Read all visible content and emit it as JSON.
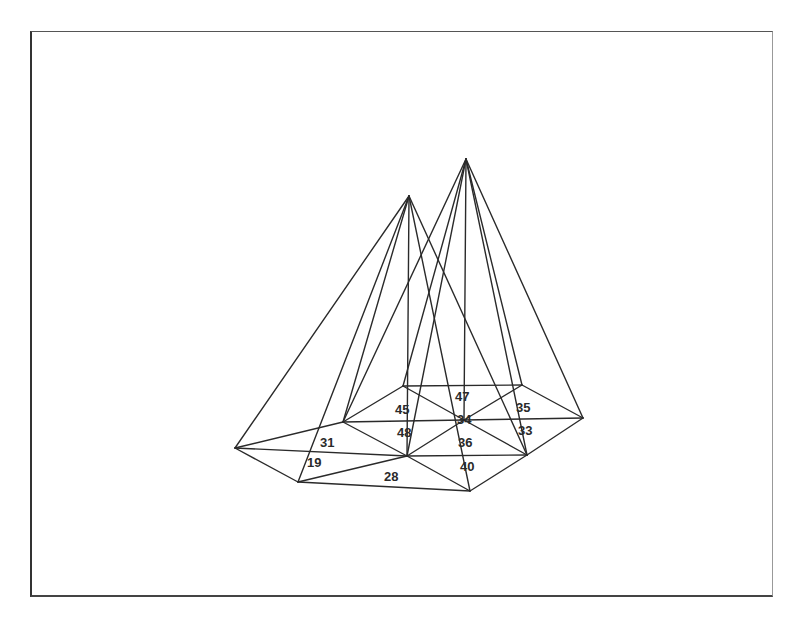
{
  "diagram": {
    "type": "3d-wireframe-pyramids-on-triangulated-mesh",
    "colors": {
      "background": "#ffffff",
      "line": "#2a2a2a",
      "text": "#2a2a2a",
      "frame": "#333333"
    },
    "frame": {
      "x": 30,
      "y": 31,
      "width": 743,
      "height": 566
    },
    "apexes": [
      {
        "id": "apex-left",
        "x": 409,
        "y": 196
      },
      {
        "id": "apex-right",
        "x": 466,
        "y": 159
      }
    ],
    "vertices": [
      {
        "id": "v-left",
        "x": 235,
        "y": 448
      },
      {
        "id": "v-bottom-left",
        "x": 298,
        "y": 482
      },
      {
        "id": "v-mid-left",
        "x": 343,
        "y": 422
      },
      {
        "id": "v-top-left",
        "x": 403,
        "y": 386
      },
      {
        "id": "v-center",
        "x": 407,
        "y": 456
      },
      {
        "id": "v-inner",
        "x": 464,
        "y": 420
      },
      {
        "id": "v-top-right",
        "x": 522,
        "y": 385
      },
      {
        "id": "v-right",
        "x": 583,
        "y": 418
      },
      {
        "id": "v-lower-right",
        "x": 527,
        "y": 455
      },
      {
        "id": "v-bottom",
        "x": 470,
        "y": 491
      }
    ],
    "mesh_edges": [
      [
        235,
        448,
        298,
        482
      ],
      [
        235,
        448,
        343,
        422
      ],
      [
        235,
        448,
        407,
        456
      ],
      [
        298,
        482,
        407,
        456
      ],
      [
        298,
        482,
        470,
        491
      ],
      [
        343,
        422,
        403,
        386
      ],
      [
        343,
        422,
        407,
        456
      ],
      [
        343,
        422,
        464,
        420
      ],
      [
        403,
        386,
        522,
        385
      ],
      [
        403,
        386,
        464,
        420
      ],
      [
        407,
        456,
        464,
        420
      ],
      [
        407,
        456,
        470,
        491
      ],
      [
        407,
        456,
        527,
        455
      ],
      [
        464,
        420,
        522,
        385
      ],
      [
        464,
        420,
        583,
        418
      ],
      [
        464,
        420,
        527,
        455
      ],
      [
        522,
        385,
        583,
        418
      ],
      [
        583,
        418,
        527,
        455
      ],
      [
        527,
        455,
        470,
        491
      ]
    ],
    "apex_edges": [
      [
        409,
        196,
        235,
        448
      ],
      [
        409,
        196,
        298,
        482
      ],
      [
        409,
        196,
        343,
        422
      ],
      [
        409,
        196,
        407,
        456
      ],
      [
        409,
        196,
        470,
        491
      ],
      [
        409,
        196,
        527,
        455
      ],
      [
        466,
        159,
        343,
        422
      ],
      [
        466,
        159,
        403,
        386
      ],
      [
        466,
        159,
        407,
        456
      ],
      [
        466,
        159,
        464,
        420
      ],
      [
        466,
        159,
        522,
        385
      ],
      [
        466,
        159,
        583,
        418
      ],
      [
        466,
        159,
        527,
        455
      ]
    ],
    "labels": [
      {
        "text": "47",
        "x": 455,
        "y": 401
      },
      {
        "text": "45",
        "x": 395,
        "y": 414
      },
      {
        "text": "35",
        "x": 516,
        "y": 412
      },
      {
        "text": "34",
        "x": 457,
        "y": 424
      },
      {
        "text": "48",
        "x": 397,
        "y": 437
      },
      {
        "text": "33",
        "x": 518,
        "y": 435
      },
      {
        "text": "31",
        "x": 320,
        "y": 447
      },
      {
        "text": "36",
        "x": 458,
        "y": 447
      },
      {
        "text": "19",
        "x": 307,
        "y": 467
      },
      {
        "text": "40",
        "x": 460,
        "y": 471
      },
      {
        "text": "28",
        "x": 384,
        "y": 481
      }
    ]
  }
}
